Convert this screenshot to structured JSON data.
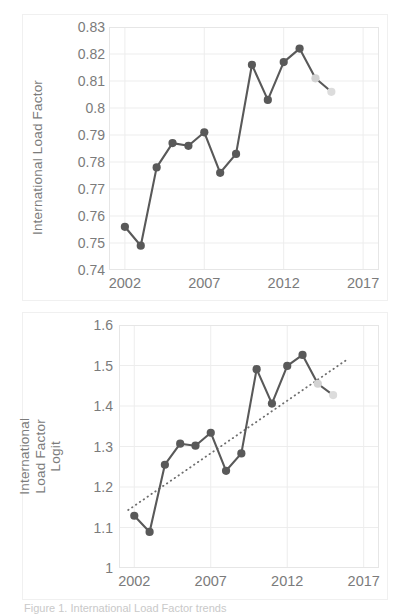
{
  "caption": "Figure 1. International Load Factor trends",
  "colors": {
    "series_dark": "#595959",
    "series_light": "#d2d2d2",
    "grid": "#ededed",
    "frame": "#e6e6e6",
    "tick_text": "#7b7b7b",
    "trend": "#6e6e6e"
  },
  "chart_data": [
    {
      "id": "load-factor",
      "type": "line",
      "title": "",
      "xlabel": "",
      "ylabel": "International Load Factor",
      "xlim": [
        2001,
        2018
      ],
      "ylim": [
        0.74,
        0.83
      ],
      "xticks": [
        "2002",
        "2007",
        "2012",
        "2017"
      ],
      "xtick_values": [
        2002,
        2007,
        2012,
        2017
      ],
      "yticks": [
        "0.83",
        "0.82",
        "0.81",
        "0.8",
        "0.79",
        "0.78",
        "0.77",
        "0.76",
        "0.75",
        "0.74"
      ],
      "ytick_values": [
        0.83,
        0.82,
        0.81,
        0.8,
        0.79,
        0.78,
        0.77,
        0.76,
        0.75,
        0.74
      ],
      "grid": true,
      "legend": "none",
      "x": [
        2002,
        2003,
        2004,
        2005,
        2006,
        2007,
        2008,
        2009,
        2010,
        2011,
        2012,
        2013,
        2014,
        2015
      ],
      "values": [
        0.756,
        0.749,
        0.778,
        0.787,
        0.786,
        0.791,
        0.776,
        0.783,
        0.816,
        0.803,
        0.817,
        0.822,
        0.811,
        0.806
      ],
      "forecast_from_index": 12,
      "series": [
        {
          "name": "International Load Factor",
          "values": [
            0.756,
            0.749,
            0.778,
            0.787,
            0.786,
            0.791,
            0.776,
            0.783,
            0.816,
            0.803,
            0.817,
            0.822,
            0.811,
            0.806
          ]
        }
      ]
    },
    {
      "id": "load-factor-logit",
      "type": "line",
      "title": "",
      "xlabel": "",
      "ylabel": "International Load Factor Logit",
      "xlim": [
        2001,
        2018
      ],
      "ylim": [
        1.0,
        1.6
      ],
      "xticks": [
        "2002",
        "2007",
        "2012",
        "2017"
      ],
      "xtick_values": [
        2002,
        2007,
        2012,
        2017
      ],
      "yticks": [
        "1.6",
        "1.5",
        "1.4",
        "1.3",
        "1.2",
        "1.1",
        "1"
      ],
      "ytick_values": [
        1.6,
        1.5,
        1.4,
        1.3,
        1.2,
        1.1,
        1.0
      ],
      "grid": true,
      "legend": "none",
      "x": [
        2002,
        2003,
        2004,
        2005,
        2006,
        2007,
        2008,
        2009,
        2010,
        2011,
        2012,
        2013,
        2014,
        2015
      ],
      "values": [
        1.129,
        1.089,
        1.255,
        1.307,
        1.302,
        1.334,
        1.24,
        1.283,
        1.491,
        1.406,
        1.499,
        1.526,
        1.455,
        1.427
      ],
      "forecast_from_index": 12,
      "series": [
        {
          "name": "International Load Factor Logit",
          "values": [
            1.129,
            1.089,
            1.255,
            1.307,
            1.302,
            1.334,
            1.24,
            1.283,
            1.491,
            1.406,
            1.499,
            1.526,
            1.455,
            1.427
          ]
        }
      ],
      "trendline": {
        "type": "linear",
        "x": [
          2001.6,
          2016.0
        ],
        "y": [
          1.143,
          1.517
        ],
        "style": "dotted"
      }
    }
  ]
}
